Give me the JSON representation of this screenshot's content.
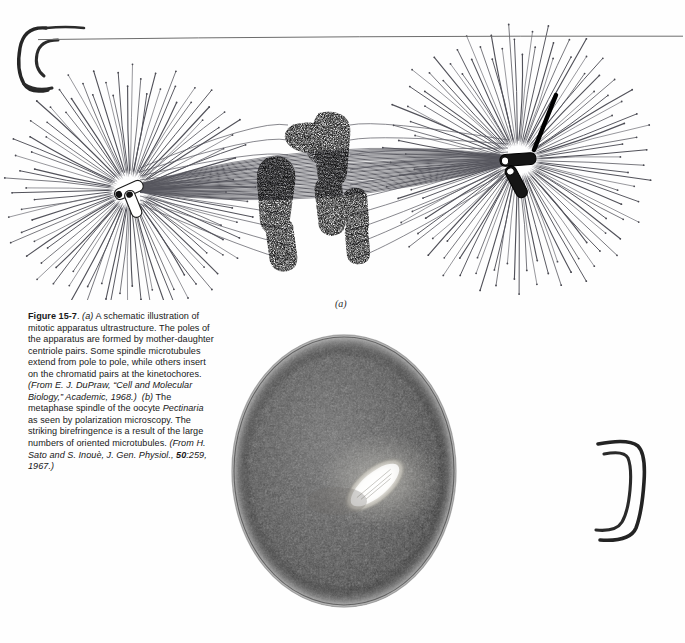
{
  "figure": {
    "number": "Figure 15-7",
    "panel_a_label": "(a)",
    "panel_b_label": "(b)",
    "caption_segments": {
      "fig_num": "Figure 15-7",
      "s1_marker": "(a)",
      "s1_text": " A schematic illustration of mitotic apparatus ultrastructure.  The poles of the apparatus are formed by mother-daughter centriole pairs.  Some spindle microtubules extend from pole to pole, while others insert on the chromatid pairs at the kinetochores.  ",
      "s1_source": "(From E. J. DuPraw, “Cell and Molecular Biology,” Academic, 1968.)",
      "s2_marker": "(b)",
      "s2_text": " The metaphase spindle of the oocyte ",
      "s2_species": "Pectinaria",
      "s2_text2": " as seen by polarization microscopy.  The striking birefringence is a result of the large numbers of oriented microtubules.  ",
      "s2_source_pre": "(From H. Sato and S. Inouè, J. Gen. Physiol., ",
      "s2_volume": "50",
      "s2_source_post": ":259, 1967.)"
    },
    "full_caption": "Figure 15-7. (a) A schematic illustration of mitotic apparatus ultrastructure.  The poles of the apparatus are formed by mother-daughter centriole pairs.  Some spindle microtubules extend from pole to pole, while others insert on the chromatid pairs at the kinetochores.  (From E. J. DuPraw, “Cell and Molecular Biology,” Academic, 1968.)  (b) The metaphase spindle of the oocyte Pectinaria as seen by polarization microscopy.  The striking birefringence is a result of the large numbers of oriented microtubules.  (From H. Sato and S. Inouè, J. Gen. Physiol., 50:259, 1967.)"
  },
  "schematic": {
    "name": "mitotic-apparatus-schematic",
    "structures": [
      {
        "name": "left-aster",
        "cx": 130,
        "cy": 190,
        "rays": 96,
        "inner_r": 16,
        "outer_r": 120
      },
      {
        "name": "right-aster",
        "cx": 518,
        "cy": 160,
        "rays": 104,
        "inner_r": 16,
        "outer_r": 128
      },
      {
        "name": "left-centriole-pair",
        "cx": 130,
        "cy": 190
      },
      {
        "name": "right-centriole-pair",
        "cx": 518,
        "cy": 160
      },
      {
        "name": "spindle-microtubule-bundle",
        "from_x": 140,
        "from_y": 188,
        "to_x": 508,
        "to_y": 160,
        "count": 34
      },
      {
        "name": "chromosome-group",
        "cx": 318,
        "cy": 195,
        "count": 5
      }
    ],
    "colors": {
      "line": "#4a4a50",
      "chromosome": "#2b2b2b",
      "centriole_dark": "#141414",
      "background": "#ffffff"
    }
  },
  "micrograph": {
    "name": "polarization-micrograph-oocyte-spindle",
    "subject": "Pectinaria oocyte metaphase spindle",
    "cell": {
      "cx": 113,
      "cy": 140,
      "rx": 112,
      "ry": 136
    },
    "spindle": {
      "cx": 144,
      "cy": 154,
      "rx": 36,
      "ry": 17,
      "rotation_deg": -40
    },
    "colors": {
      "cell_dark": "#3a3a3a",
      "cell_mid": "#565656",
      "spindle_bright": "#f2f0ea",
      "background": "#ffffff"
    }
  },
  "annotations": {
    "left_bracket": "hand-drawn-bracket-open",
    "right_bracket": "hand-drawn-bracket-close",
    "top_rule": "thin-horizontal-rule"
  }
}
